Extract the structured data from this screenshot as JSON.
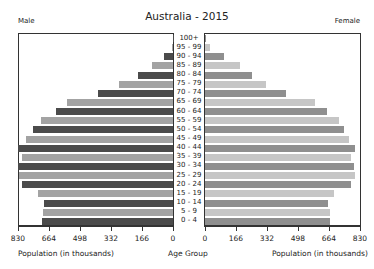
{
  "chart_data": {
    "type": "bar",
    "title": "Australia - 2015",
    "orientation": "horizontal-pyramid",
    "left_label": "Male",
    "right_label": "Female",
    "xlabel_left": "Population (in thousands)",
    "xlabel_center": "Age Group",
    "xlabel_right": "Population (in thousands)",
    "xlim": [
      0,
      830
    ],
    "male_ticks": [
      "830",
      "664",
      "498",
      "332",
      "166",
      "0"
    ],
    "female_ticks": [
      "0",
      "166",
      "332",
      "498",
      "664",
      "830"
    ],
    "categories": [
      "100+",
      "95 - 99",
      "90 - 94",
      "85 - 89",
      "80 - 84",
      "75 - 79",
      "70 - 74",
      "65 - 69",
      "60 - 64",
      "55 - 59",
      "50 - 54",
      "45 - 49",
      "40 - 44",
      "35 - 39",
      "30 - 34",
      "25 - 29",
      "20 - 24",
      "15 - 19",
      "10 - 14",
      "5 - 9",
      "0 - 4"
    ],
    "series": [
      {
        "name": "Male",
        "values": [
          2,
          6,
          48,
          112,
          187,
          290,
          402,
          568,
          627,
          707,
          750,
          787,
          830,
          808,
          830,
          825,
          808,
          723,
          690,
          696,
          700
        ]
      },
      {
        "name": "Female",
        "values": [
          8,
          25,
          100,
          187,
          252,
          327,
          434,
          589,
          653,
          718,
          744,
          771,
          803,
          782,
          798,
          803,
          782,
          690,
          659,
          669,
          669
        ]
      }
    ],
    "grid": false,
    "legend": "none"
  },
  "colors": {
    "male_dark": "#4b4b4b",
    "male_light": "#a3a3a3",
    "female_dark": "#8f8f8f",
    "female_light": "#c6c6c6",
    "axis": "#333333"
  }
}
